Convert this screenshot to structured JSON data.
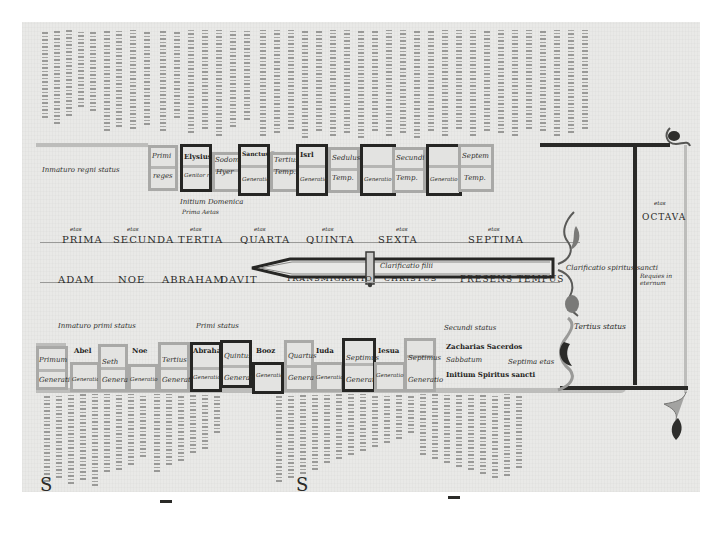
{
  "manuscript": {
    "upper_band": {
      "left_label": "Inmaturo regni status",
      "boxes": [
        {
          "top": "Primi",
          "bottom": "reges"
        },
        {
          "top": "Elysius",
          "bottom": "Genitor regum",
          "mark": "x"
        },
        {
          "top": "Sodoma",
          "bottom": "Hyer"
        },
        {
          "top": "Sanctus Rex",
          "bottom": "Generatio",
          "mark": "x"
        },
        {
          "top": "Tertius",
          "bottom": "Temp."
        },
        {
          "top": "Isrl",
          "bottom": "Generatio",
          "mark": "x"
        },
        {
          "top": "Sedulus",
          "bottom": "Temp."
        },
        {
          "top": "Generatio",
          "bottom": "Temp.",
          "mark": "x"
        },
        {
          "top": "Secundi",
          "bottom": "Temp."
        },
        {
          "top": "Generatio",
          "bottom": "Temp.",
          "mark": "x"
        },
        {
          "top": "Septem",
          "bottom": "Temp."
        }
      ],
      "below_note_1": "Initium Domenica",
      "below_note_2": "Prima Aetas"
    },
    "ages_row": {
      "labels": [
        "PRIMA",
        "SECUNDA",
        "TERTIA",
        "QUARTA",
        "QUINTA",
        "SEXTA",
        "SEPTIMA"
      ],
      "superscripts": [
        "etas",
        "etas",
        "etas",
        "etas",
        "etas",
        "etas",
        "etas"
      ]
    },
    "patriarchs_row": {
      "labels": [
        "ADAM",
        "NOE",
        "ABRAHAM",
        "DAVIT",
        "TRANSMIGRATIO",
        "CHRISTUS",
        "PRESENS TEMPUS"
      ]
    },
    "sword": {
      "blade_label": "Clarificatio filii",
      "right_label": "Clarificatio spiritus sancti"
    },
    "right_column": {
      "title": "OCTAVA",
      "superscript": "etas",
      "note": "Requies in eternum"
    },
    "lower_band": {
      "left_label": "Inmaturo primi status",
      "mid_label": "Primi status",
      "boxes": [
        {
          "top": "Primum",
          "bottom": "Generatio"
        },
        {
          "top": "Abel",
          "bottom": "Generatio"
        },
        {
          "top": "Seth",
          "bottom": "Generatio"
        },
        {
          "top": "Noe",
          "bottom": "Generatio"
        },
        {
          "top": "Tertius",
          "bottom": "Generatio"
        },
        {
          "top": "Abraham",
          "bottom": "Generatio",
          "mark": "x"
        },
        {
          "top": "Quintus",
          "bottom": "Generatio"
        },
        {
          "top": "Booz",
          "bottom": "Generatio",
          "mark": "x"
        },
        {
          "top": "Quartus",
          "bottom": "Generatio"
        },
        {
          "top": "Iuda",
          "bottom": "Generatio"
        },
        {
          "top": "Septimus",
          "bottom": "Generatio"
        },
        {
          "top": "Iesua",
          "bottom": "Generatio",
          "mark": "x"
        },
        {
          "top": "Septimus",
          "bottom": "Generatio"
        }
      ],
      "right_notes": [
        "Secundi status",
        "Zacharias Sacerdos",
        "Sabbatum",
        "Septima etas",
        "Initium Spiritus sancti"
      ],
      "far_right_label": "Tertius status"
    },
    "colors": {
      "parchment": "#e9e9e7",
      "ink": "#2a2a28",
      "gray_band": "#bdbdbb",
      "dark_band": "#262624",
      "margin": "#ffffff"
    }
  }
}
